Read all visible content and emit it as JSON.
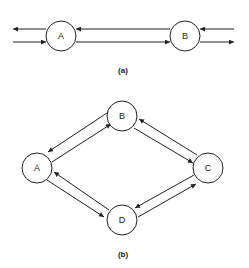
{
  "diagrams": [
    {
      "id": "a",
      "caption": "(a)",
      "nodes": [
        {
          "id": "A",
          "label": "A"
        },
        {
          "id": "B",
          "label": "B"
        }
      ],
      "edges": [
        {
          "from": "B",
          "to": "A",
          "kind": "node-to-node"
        },
        {
          "from": "A",
          "to": "B",
          "kind": "node-to-node"
        },
        {
          "from": "A",
          "to": "out-left",
          "kind": "external-out"
        },
        {
          "from": "in-left",
          "to": "A",
          "kind": "external-in"
        },
        {
          "from": "in-right",
          "to": "B",
          "kind": "external-in"
        },
        {
          "from": "B",
          "to": "out-right",
          "kind": "external-out"
        }
      ]
    },
    {
      "id": "b",
      "caption": "(b)",
      "nodes": [
        {
          "id": "A",
          "label": "A"
        },
        {
          "id": "B",
          "label": "B"
        },
        {
          "id": "C",
          "label": "C"
        },
        {
          "id": "D",
          "label": "D"
        }
      ],
      "edges": [
        {
          "from": "B",
          "to": "A"
        },
        {
          "from": "A",
          "to": "B"
        },
        {
          "from": "C",
          "to": "B"
        },
        {
          "from": "B",
          "to": "C"
        },
        {
          "from": "D",
          "to": "A"
        },
        {
          "from": "A",
          "to": "D"
        },
        {
          "from": "C",
          "to": "D"
        },
        {
          "from": "D",
          "to": "C"
        }
      ]
    }
  ]
}
